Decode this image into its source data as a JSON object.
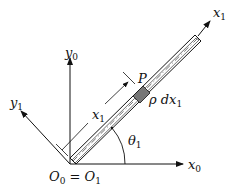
{
  "diagram": {
    "labels": {
      "x1_axis": {
        "main": "x",
        "sub": "1"
      },
      "y0_axis": {
        "main": "y",
        "sub": "0"
      },
      "y1_axis": {
        "main": "y",
        "sub": "1"
      },
      "x0_axis": {
        "main": "x",
        "sub": "0"
      },
      "x1_distance": {
        "main": "x",
        "sub": "1"
      },
      "point_p": "P",
      "mass_element": {
        "main": "ρ dx",
        "sub": "1"
      },
      "angle": {
        "main": "θ",
        "sub": "1"
      },
      "origin": {
        "a": "O",
        "a_sub": "0",
        "eq": " = ",
        "b": "O",
        "b_sub": "1"
      }
    },
    "colors": {
      "line": "#111111",
      "element_fill": "#777777"
    }
  }
}
